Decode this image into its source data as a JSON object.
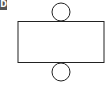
{
  "choice_label": "D",
  "figure": {
    "shapes": [
      {
        "type": "circle",
        "role": "top-base",
        "cx": 61,
        "cy": 12,
        "r": 9
      },
      {
        "type": "rectangle",
        "role": "lateral-surface",
        "x": 18,
        "y": 21,
        "width": 87,
        "height": 41
      },
      {
        "type": "circle",
        "role": "bottom-base",
        "cx": 61,
        "cy": 72,
        "r": 9
      }
    ],
    "stroke_color": "#222222",
    "fill_color": "#ffffff"
  }
}
